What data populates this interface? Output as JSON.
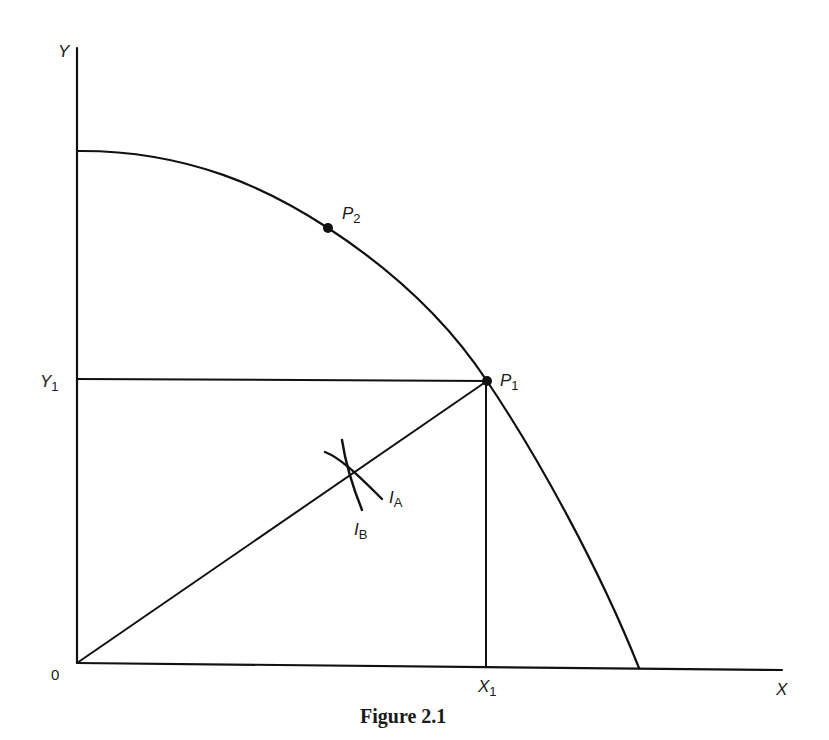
{
  "figure": {
    "caption": "Figure 2.1",
    "axes": {
      "y_label": "Y",
      "x_label": "X",
      "origin_label": "0"
    },
    "ticks": {
      "y1": {
        "main": "Y",
        "sub": "1"
      },
      "x1": {
        "main": "X",
        "sub": "1"
      }
    },
    "points": {
      "p1": {
        "main": "P",
        "sub": "1"
      },
      "p2": {
        "main": "P",
        "sub": "2"
      }
    },
    "curves": {
      "ia": {
        "main": "I",
        "sub": "A"
      },
      "ib": {
        "main": "I",
        "sub": "B"
      }
    },
    "colors": {
      "ink": "#111111",
      "background": "#ffffff"
    }
  }
}
